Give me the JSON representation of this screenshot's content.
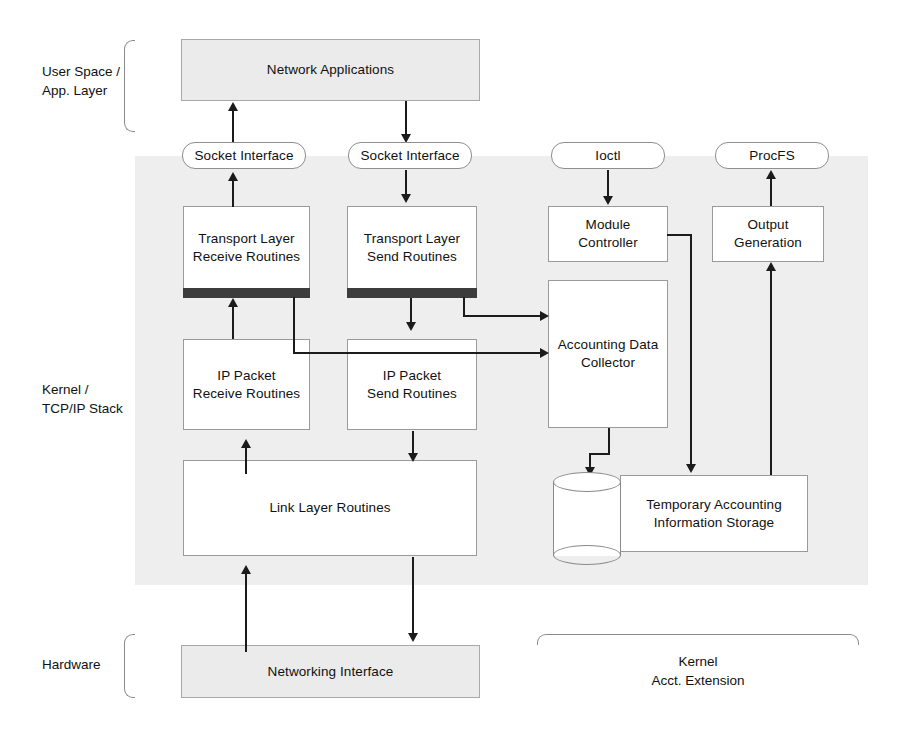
{
  "diagram": {
    "type": "block-architecture-diagram",
    "colors": {
      "kernel_region_fill": "#eeeeee",
      "box_stroke": "#9a9a9a",
      "shaded_box_fill": "#ebebeb",
      "connector": "#1b1b1b",
      "hook_bar": "#3c3c3c",
      "page_background": "#ffffff"
    }
  },
  "layer_labels": {
    "user_space": "User Space /\nApp. Layer",
    "kernel": "Kernel /\nTCP/IP Stack",
    "hardware": "Hardware",
    "kernel_acct_extension": "Kernel\nAcct. Extension"
  },
  "nodes": {
    "network_applications": "Network Applications",
    "socket_interface_left": "Socket Interface",
    "socket_interface_right": "Socket Interface",
    "ioctl": "Ioctl",
    "procfs": "ProcFS",
    "transport_receive": "Transport Layer\nReceive Routines",
    "transport_send": "Transport Layer\nSend Routines",
    "ip_receive": "IP Packet\nReceive Routines",
    "ip_send": "IP Packet\nSend Routines",
    "link_layer": "Link Layer Routines",
    "networking_interface": "Networking Interface",
    "module_controller": "Module\nController",
    "output_generation": "Output\nGeneration",
    "accounting_data_collector": "Accounting Data\nCollector",
    "temporary_storage": "Temporary Accounting\nInformation Storage",
    "storage_cylinder": "database-cylinder"
  },
  "edges": [
    {
      "from": "socket_interface_left",
      "to": "network_applications",
      "direction": "up"
    },
    {
      "from": "network_applications",
      "to": "socket_interface_right",
      "direction": "down"
    },
    {
      "from": "transport_receive",
      "to": "socket_interface_left",
      "direction": "up"
    },
    {
      "from": "socket_interface_right",
      "to": "transport_send",
      "direction": "down"
    },
    {
      "from": "ip_receive",
      "to": "transport_receive",
      "direction": "up"
    },
    {
      "from": "transport_send",
      "to": "ip_send",
      "direction": "down"
    },
    {
      "from": "link_layer",
      "to": "ip_receive",
      "direction": "up"
    },
    {
      "from": "ip_send",
      "to": "link_layer",
      "direction": "down"
    },
    {
      "from": "networking_interface",
      "to": "link_layer",
      "direction": "up"
    },
    {
      "from": "link_layer",
      "to": "networking_interface",
      "direction": "down"
    },
    {
      "from": "transport_send_hook",
      "to": "accounting_data_collector",
      "direction": "right"
    },
    {
      "from": "transport_receive_hook",
      "to": "accounting_data_collector",
      "direction": "right"
    },
    {
      "from": "ioctl",
      "to": "module_controller",
      "direction": "down"
    },
    {
      "from": "module_controller",
      "to": "temporary_storage",
      "direction": "down"
    },
    {
      "from": "accounting_data_collector",
      "to": "storage_cylinder",
      "direction": "down"
    },
    {
      "from": "temporary_storage",
      "to": "output_generation",
      "direction": "up"
    },
    {
      "from": "output_generation",
      "to": "procfs",
      "direction": "up"
    }
  ]
}
